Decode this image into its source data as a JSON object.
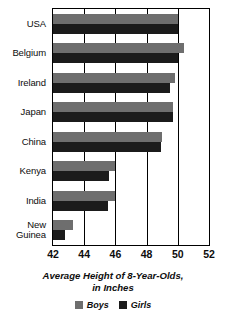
{
  "chart_data": {
    "type": "bar",
    "orientation": "horizontal",
    "title": "",
    "xlabel": "Average Height of 8-Year-Olds, in Inches",
    "ylabel": "",
    "xlim": [
      42,
      52
    ],
    "xticks": [
      42,
      44,
      46,
      48,
      50,
      52
    ],
    "xtick_labels": [
      "42",
      "44",
      "46",
      "48",
      "50",
      "52"
    ],
    "grid": true,
    "legend_position": "bottom",
    "categories": [
      "USA",
      "Belgium",
      "Ireland",
      "Japan",
      "China",
      "Kenya",
      "India",
      "New Guinea"
    ],
    "series": [
      {
        "name": "Boys",
        "color": "#6e6e6e",
        "values": [
          50.0,
          50.4,
          49.8,
          49.7,
          49.0,
          46.0,
          46.0,
          43.3
        ]
      },
      {
        "name": "Girls",
        "color": "#1b1b1b",
        "values": [
          50.0,
          50.0,
          49.5,
          49.7,
          48.9,
          45.6,
          45.5,
          42.8
        ]
      }
    ]
  },
  "axis_title_lines": [
    "Average Height of 8-Year-Olds,",
    "in Inches"
  ],
  "legend": {
    "items": [
      {
        "label": "Boys",
        "color": "#6e6e6e"
      },
      {
        "label": "Girls",
        "color": "#1b1b1b"
      }
    ]
  }
}
